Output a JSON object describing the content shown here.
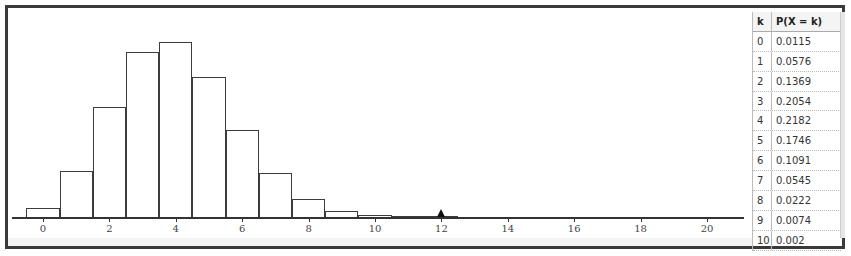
{
  "chart_data": {
    "type": "bar",
    "title": "",
    "xlabel": "",
    "ylabel": "",
    "categories": [
      0,
      1,
      2,
      3,
      4,
      5,
      6,
      7,
      8,
      9,
      10,
      11,
      12,
      13,
      14,
      15,
      16,
      17,
      18,
      19,
      20
    ],
    "values": [
      0.0115,
      0.0576,
      0.1369,
      0.2054,
      0.2182,
      0.1746,
      0.1091,
      0.0545,
      0.0222,
      0.0074,
      0.002,
      0.0005,
      0.0001,
      0,
      0,
      0,
      0,
      0,
      0,
      0,
      0
    ],
    "x_ticks": [
      0,
      2,
      4,
      6,
      8,
      10,
      12,
      14,
      16,
      18,
      20
    ],
    "xlim": [
      -1,
      21
    ],
    "marker": {
      "x": 12,
      "shape": "triangle"
    },
    "grid": false,
    "legend": null
  },
  "table": {
    "headers": {
      "k": "k",
      "p": "P(X = k)"
    },
    "rows": [
      {
        "k": "0",
        "p": "0.0115"
      },
      {
        "k": "1",
        "p": "0.0576"
      },
      {
        "k": "2",
        "p": "0.1369"
      },
      {
        "k": "3",
        "p": "0.2054"
      },
      {
        "k": "4",
        "p": "0.2182"
      },
      {
        "k": "5",
        "p": "0.1746"
      },
      {
        "k": "6",
        "p": "0.1091"
      },
      {
        "k": "7",
        "p": "0.0545"
      },
      {
        "k": "8",
        "p": "0.0222"
      },
      {
        "k": "9",
        "p": "0.0074"
      },
      {
        "k": "10",
        "p": "0.002"
      }
    ]
  },
  "axis": {
    "tick_labels": [
      "0",
      "2",
      "4",
      "6",
      "8",
      "10",
      "12",
      "14",
      "16",
      "18",
      "20"
    ]
  }
}
